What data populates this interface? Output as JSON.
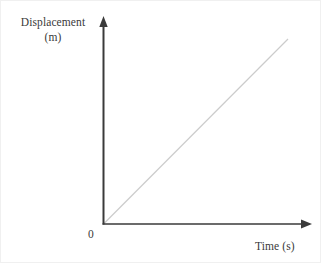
{
  "figure": {
    "background_color": "#ffffff",
    "axis_color": "#3a3a3a",
    "line_color": "#cccccc",
    "text_color": "#3a3a3a",
    "origin_label": "0"
  },
  "labels": {
    "y_axis_name": "Displacement",
    "y_axis_unit": "(m)",
    "x_axis_full": "Time (s)"
  },
  "chart_data": {
    "type": "line",
    "title": "",
    "subtitle": "",
    "xlabel": "Time (s)",
    "ylabel": "Displacement (m)",
    "xlim": [
      0,
      10
    ],
    "ylim": [
      0,
      10
    ],
    "grid": false,
    "legend": null,
    "xticks": [],
    "yticks": [],
    "xticklabels": [],
    "yticklabels": [],
    "annotations": [
      "0"
    ],
    "series": [
      {
        "name": "Displacement",
        "color": "#cccccc",
        "x": [
          0,
          10
        ],
        "y": [
          0,
          10
        ],
        "description": "straight line of constant positive slope through the origin (uniform velocity)"
      }
    ]
  }
}
